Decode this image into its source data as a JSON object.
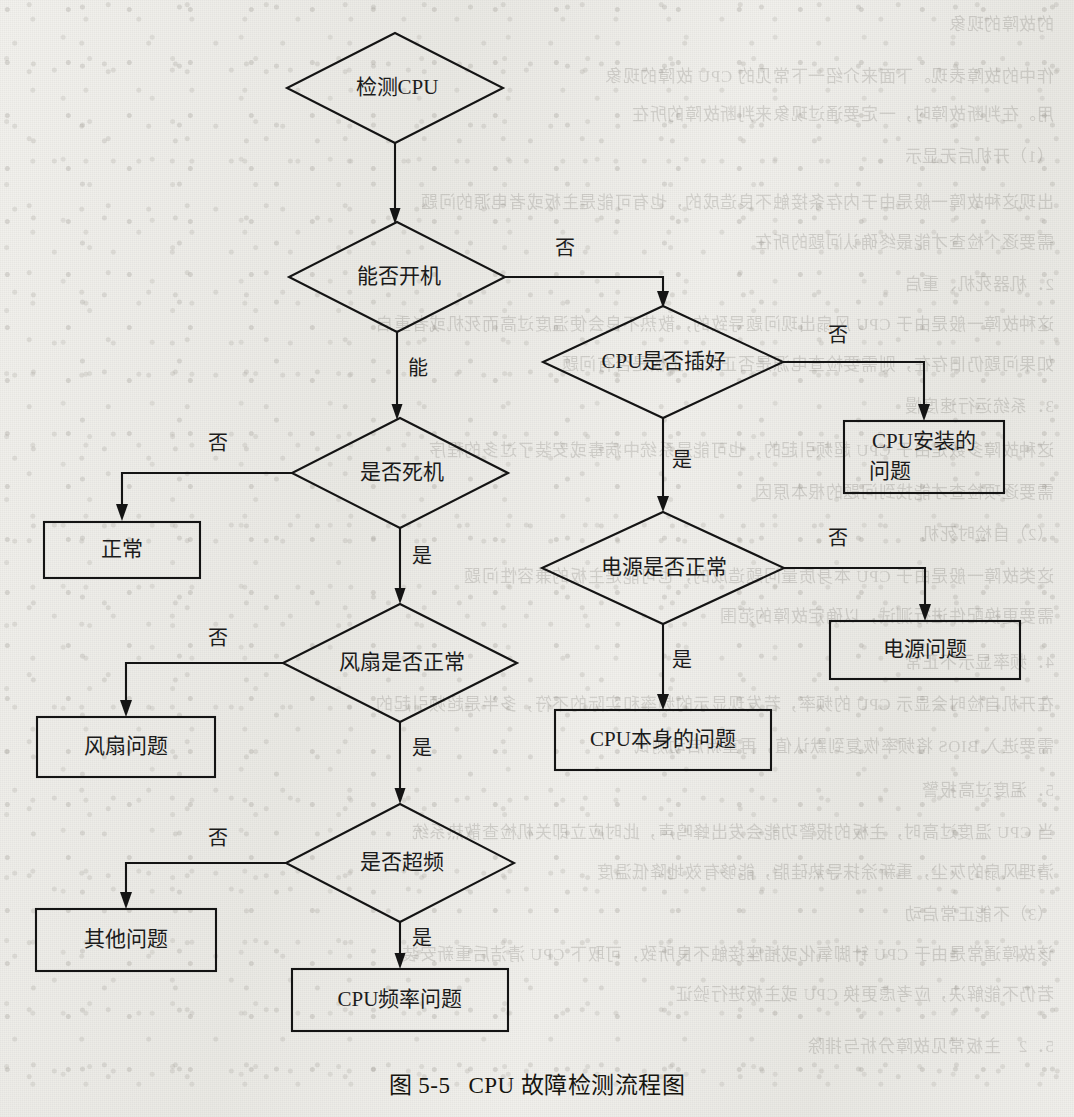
{
  "document": {
    "caption_number": "图 5-5",
    "caption_title": "CPU 故障检测流程图",
    "page_background": "#eeede9",
    "ink_color": "#141414"
  },
  "flowchart": {
    "type": "flowchart",
    "title": "CPU 故障检测流程图",
    "nodes": [
      {
        "id": "start",
        "shape": "diamond",
        "label": "检测CPU",
        "x": 395,
        "y": 88,
        "w": 216,
        "h": 110
      },
      {
        "id": "can_boot",
        "shape": "diamond",
        "label": "能否开机",
        "x": 397,
        "y": 277,
        "w": 216,
        "h": 110
      },
      {
        "id": "cpu_seated",
        "shape": "diamond",
        "label": "CPU是否插好",
        "x": 663,
        "y": 362,
        "w": 240,
        "h": 112
      },
      {
        "id": "install_prob",
        "shape": "rect",
        "label": "CPU安装的",
        "label2": "问题",
        "x": 924,
        "y": 457,
        "w": 160,
        "h": 72
      },
      {
        "id": "is_crash",
        "shape": "diamond",
        "label": "是否死机",
        "x": 400,
        "y": 473,
        "w": 216,
        "h": 110
      },
      {
        "id": "normal",
        "shape": "rect",
        "label": "正常",
        "x": 122,
        "y": 550,
        "w": 156,
        "h": 56
      },
      {
        "id": "psu_ok",
        "shape": "diamond",
        "label": "电源是否正常",
        "x": 663,
        "y": 568,
        "w": 242,
        "h": 112
      },
      {
        "id": "psu_prob",
        "shape": "rect",
        "label": "电源问题",
        "x": 925,
        "y": 650,
        "w": 190,
        "h": 58
      },
      {
        "id": "fan_ok",
        "shape": "diamond",
        "label": "风扇是否正常",
        "x": 400,
        "y": 663,
        "w": 234,
        "h": 118
      },
      {
        "id": "fan_prob",
        "shape": "rect",
        "label": "风扇问题",
        "x": 126,
        "y": 747,
        "w": 178,
        "h": 60
      },
      {
        "id": "cpu_itself",
        "shape": "rect",
        "label": "CPU本身的问题",
        "x": 663,
        "y": 740,
        "w": 216,
        "h": 60
      },
      {
        "id": "overclock",
        "shape": "diamond",
        "label": "是否超频",
        "x": 400,
        "y": 863,
        "w": 228,
        "h": 118
      },
      {
        "id": "other_prob",
        "shape": "rect",
        "label": "其他问题",
        "x": 126,
        "y": 940,
        "w": 180,
        "h": 62
      },
      {
        "id": "freq_prob",
        "shape": "rect",
        "label": "CPU频率问题",
        "x": 400,
        "y": 1000,
        "w": 216,
        "h": 62
      }
    ],
    "edges": [
      {
        "from": "start",
        "to": "can_boot",
        "label": "",
        "label_x": 0,
        "label_y": 0
      },
      {
        "from": "can_boot",
        "to": "cpu_seated",
        "label": "否",
        "label_x": 565,
        "label_y": 250
      },
      {
        "from": "can_boot",
        "to": "is_crash",
        "label": "能",
        "label_x": 418,
        "label_y": 370
      },
      {
        "from": "cpu_seated",
        "to": "install_prob",
        "label": "否",
        "label_x": 838,
        "label_y": 337
      },
      {
        "from": "cpu_seated",
        "to": "psu_ok",
        "label": "是",
        "label_x": 682,
        "label_y": 462
      },
      {
        "from": "is_crash",
        "to": "normal",
        "label": "否",
        "label_x": 218,
        "label_y": 445
      },
      {
        "from": "is_crash",
        "to": "fan_ok",
        "label": "是",
        "label_x": 422,
        "label_y": 558
      },
      {
        "from": "psu_ok",
        "to": "psu_prob",
        "label": "否",
        "label_x": 838,
        "label_y": 540
      },
      {
        "from": "psu_ok",
        "to": "cpu_itself",
        "label": "是",
        "label_x": 682,
        "label_y": 662
      },
      {
        "from": "fan_ok",
        "to": "fan_prob",
        "label": "否",
        "label_x": 218,
        "label_y": 640
      },
      {
        "from": "fan_ok",
        "to": "overclock",
        "label": "是",
        "label_x": 422,
        "label_y": 750
      },
      {
        "from": "overclock",
        "to": "other_prob",
        "label": "否",
        "label_x": 218,
        "label_y": 840
      },
      {
        "from": "overclock",
        "to": "freq_prob",
        "label": "是",
        "label_x": 422,
        "label_y": 940
      }
    ],
    "edge_labels": {
      "yes": "是",
      "no": "否",
      "able": "能"
    }
  },
  "bleed_through_text": [
    {
      "text": "的故障的现象",
      "x": 20,
      "y": 10
    },
    {
      "text": "作中的故障表现。下面来介绍一下常见的 CPU 故障的现象",
      "x": 20,
      "y": 62
    },
    {
      "text": "用。在判断故障时，一定要通过现象来判断故障的所在",
      "x": 20,
      "y": 100
    },
    {
      "text": "（1）开机后无显示",
      "x": 20,
      "y": 142
    },
    {
      "text": "出现这种故障一般是由于内存条接触不良造成的，也有可能是主板或者电源的问题",
      "x": 20,
      "y": 188
    },
    {
      "text": "需要逐个检查才能最终确认问题的所在",
      "x": 20,
      "y": 228
    },
    {
      "text": "2．机器死机、重启",
      "x": 20,
      "y": 270
    },
    {
      "text": "这种故障一般是由于 CPU 风扇出现问题导致的，散热不良会使温度过高而死机或者重启",
      "x": 20,
      "y": 310
    },
    {
      "text": "如果问题仍旧存在，则需要检查电源是否正常，主板是否有问题",
      "x": 20,
      "y": 350
    },
    {
      "text": "3．系统运行速度慢",
      "x": 20,
      "y": 392
    },
    {
      "text": "这种故障多数是由于 CPU 超频引起的，也可能是系统中病毒或安装了过多的程序",
      "x": 20,
      "y": 436
    },
    {
      "text": "需要逐项检查才能找到问题的根本原因",
      "x": 20,
      "y": 478
    },
    {
      "text": "（2）自检时死机",
      "x": 20,
      "y": 520
    },
    {
      "text": "这类故障一般是由于 CPU 本身质量问题造成的，也可能是主板的兼容性问题",
      "x": 20,
      "y": 562
    },
    {
      "text": "需要更换配件进行测试，以确定故障的范围",
      "x": 20,
      "y": 602
    },
    {
      "text": "4．频率显示不正常",
      "x": 20,
      "y": 648
    },
    {
      "text": "在开机自检时会显示 CPU 的频率，若发现显示的频率和实际的不符，多半是超频引起的",
      "x": 20,
      "y": 690
    },
    {
      "text": "需要进入 BIOS 将频率恢复到默认值，再重新启动测试",
      "x": 20,
      "y": 732
    },
    {
      "text": "5．温度过高报警",
      "x": 20,
      "y": 776
    },
    {
      "text": "当 CPU 温度过高时，主板的报警功能会发出蜂鸣声，此时应立即关机检查散热系统",
      "x": 20,
      "y": 818
    },
    {
      "text": "清理风扇的灰尘，重新涂抹导热硅脂，能够有效地降低温度",
      "x": 20,
      "y": 858
    },
    {
      "text": "（3）不能正常启动",
      "x": 20,
      "y": 900
    },
    {
      "text": "该故障通常是由于 CPU 针脚氧化或插座接触不良所致，可取下 CPU 清洁后重新安装",
      "x": 20,
      "y": 940
    },
    {
      "text": "若仍不能解决，应考虑更换 CPU 或主板进行验证",
      "x": 20,
      "y": 980
    },
    {
      "text": "5．2　主板常见故障分析与排除",
      "x": 20,
      "y": 1032
    }
  ]
}
